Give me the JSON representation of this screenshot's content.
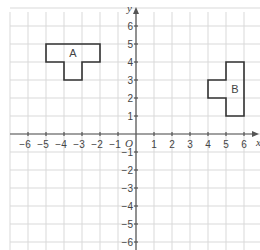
{
  "diagram": {
    "type": "coordinate-grid",
    "origin_px": {
      "x": 136,
      "y": 134
    },
    "unit_px": 18,
    "x_range": [
      -7,
      7
    ],
    "y_range": [
      -6,
      7
    ],
    "axes": {
      "x_label": "x",
      "y_label": "y",
      "origin_label": "O",
      "x_ticks": [
        -6,
        -5,
        -4,
        -3,
        -2,
        -1,
        1,
        2,
        3,
        4,
        5,
        6
      ],
      "y_ticks": [
        6,
        5,
        4,
        3,
        2,
        1,
        -1,
        -2,
        -3,
        -4,
        -5,
        -6
      ]
    },
    "colors": {
      "grid": "#d9d9d9",
      "axis": "#555555",
      "shape_stroke": "#333333",
      "text": "#444444"
    },
    "shapes": [
      {
        "label": "A",
        "label_at": [
          -3.5,
          4.5
        ],
        "vertices": [
          [
            -5,
            5
          ],
          [
            -2,
            5
          ],
          [
            -2,
            4
          ],
          [
            -3,
            4
          ],
          [
            -3,
            3
          ],
          [
            -4,
            3
          ],
          [
            -4,
            4
          ],
          [
            -5,
            4
          ]
        ]
      },
      {
        "label": "B",
        "label_at": [
          5.5,
          2.5
        ],
        "vertices": [
          [
            5,
            4
          ],
          [
            6,
            4
          ],
          [
            6,
            1
          ],
          [
            5,
            1
          ],
          [
            5,
            2
          ],
          [
            4,
            2
          ],
          [
            4,
            3
          ],
          [
            5,
            3
          ]
        ]
      }
    ]
  }
}
